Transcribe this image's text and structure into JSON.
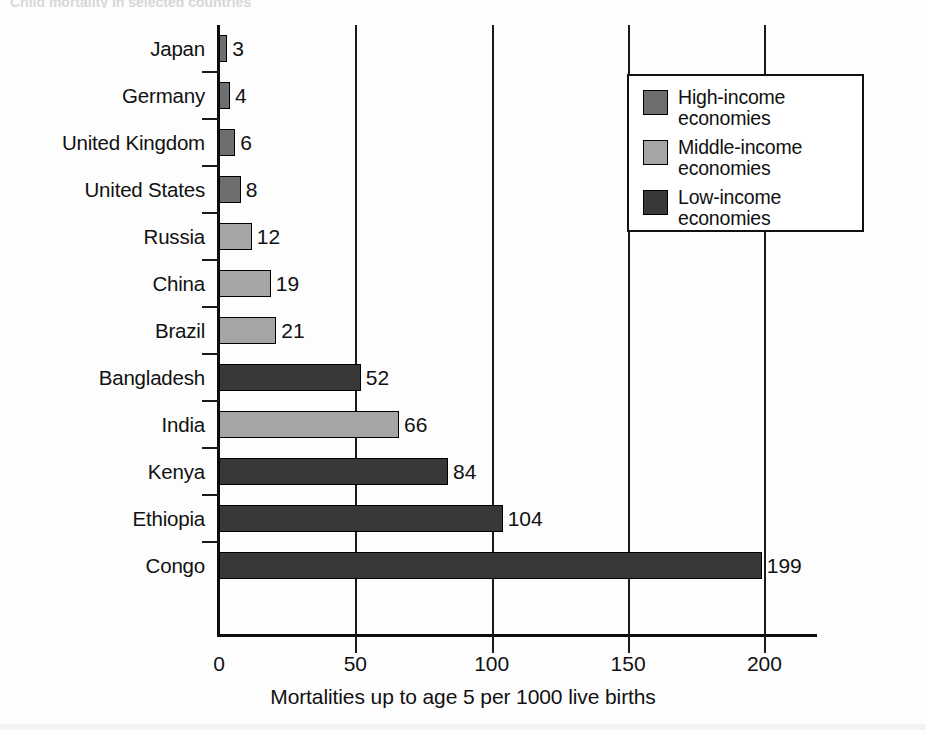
{
  "chart_data": {
    "type": "bar",
    "orientation": "horizontal",
    "title": "",
    "xlabel": "Mortalities up to age 5 per 1000 live births",
    "ylabel": "",
    "xlim": [
      0,
      220
    ],
    "xticks": [
      0,
      50,
      100,
      150,
      200
    ],
    "xtick_labels": [
      "0",
      "50",
      "100",
      "150",
      "200"
    ],
    "grid": "vertical",
    "legend_position": "upper right",
    "categories": [
      "Japan",
      "Germany",
      "United Kingdom",
      "United States",
      "Russia",
      "China",
      "Brazil",
      "Bangladesh",
      "India",
      "Kenya",
      "Ethiopia",
      "Congo"
    ],
    "values": [
      3,
      4,
      6,
      8,
      12,
      19,
      21,
      52,
      66,
      84,
      104,
      199
    ],
    "value_labels": [
      "3",
      "4",
      "6",
      "8",
      "12",
      "19",
      "21",
      "52",
      "66",
      "84",
      "104",
      "199"
    ],
    "groups": [
      "high-income",
      "high-income",
      "high-income",
      "high-income",
      "middle-income",
      "middle-income",
      "middle-income",
      "low-income",
      "middle-income",
      "low-income",
      "low-income",
      "low-income"
    ]
  },
  "legend": {
    "items": [
      {
        "label": "High-income\neconomies",
        "group": "high-income",
        "color": "#6e6e6e"
      },
      {
        "label": "Middle-income\neconomies",
        "group": "middle-income",
        "color": "#a5a5a5"
      },
      {
        "label": "Low-income\neconomies",
        "group": "low-income",
        "color": "#383838"
      }
    ]
  },
  "colors": {
    "high-income": "#6e6e6e",
    "middle-income": "#a5a5a5",
    "low-income": "#383838",
    "axis": "#0d0d0d",
    "text": "#111111",
    "background": "#fdfdfd"
  },
  "top_caption": "Child mortality in selected countries"
}
